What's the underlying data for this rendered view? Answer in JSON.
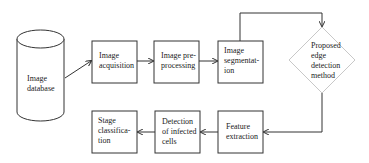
{
  "diagram": {
    "type": "flowchart",
    "nodes": [
      {
        "id": "db",
        "shape": "cylinder",
        "label_lines": [
          "Image",
          "database"
        ]
      },
      {
        "id": "acq",
        "shape": "rect",
        "label_lines": [
          "Image",
          "acquisition"
        ]
      },
      {
        "id": "pre",
        "shape": "rect",
        "label_lines": [
          "Image pre-",
          "processing"
        ]
      },
      {
        "id": "seg",
        "shape": "rect",
        "label_lines": [
          "Image",
          "segmentat-",
          "ion"
        ]
      },
      {
        "id": "edge",
        "shape": "diamond",
        "label_lines": [
          "Proposed",
          "edge",
          "detection",
          "method"
        ]
      },
      {
        "id": "feat",
        "shape": "rect",
        "label_lines": [
          "Feature",
          "extraction"
        ]
      },
      {
        "id": "det",
        "shape": "rect",
        "label_lines": [
          "Detection",
          "of infected",
          "cells"
        ]
      },
      {
        "id": "stage",
        "shape": "rect",
        "label_lines": [
          "Stage",
          "classifica-",
          "tion"
        ]
      }
    ],
    "edges": [
      {
        "from": "db",
        "to": "acq"
      },
      {
        "from": "acq",
        "to": "pre"
      },
      {
        "from": "pre",
        "to": "seg"
      },
      {
        "from": "seg",
        "to": "edge"
      },
      {
        "from": "edge",
        "to": "feat"
      },
      {
        "from": "feat",
        "to": "det"
      },
      {
        "from": "det",
        "to": "stage"
      }
    ],
    "colors": {
      "stroke": "#333333",
      "diamond_stroke": "#c8c8c8",
      "text": "#222222"
    }
  }
}
